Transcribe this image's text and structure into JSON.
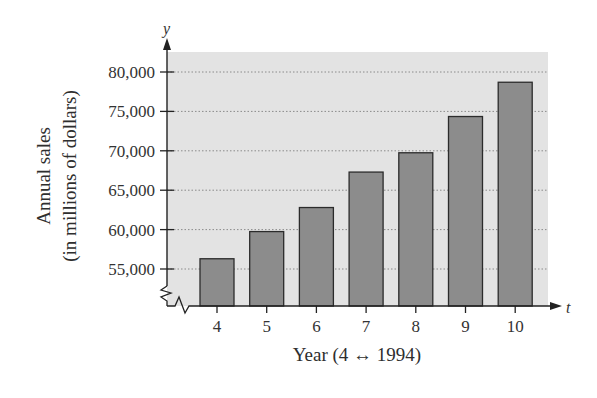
{
  "chart_data": {
    "type": "bar",
    "title": "",
    "xlabel": "Year (4 ↔ 1994)",
    "ylabel_line1": "Annual sales",
    "ylabel_line2": "(in millions of dollars)",
    "x_axis_var": "t",
    "y_axis_var": "y",
    "categories": [
      "4",
      "5",
      "6",
      "7",
      "8",
      "9",
      "10"
    ],
    "values": [
      56300,
      59750,
      62800,
      67300,
      69750,
      74350,
      78700
    ],
    "yticks": [
      55000,
      60000,
      65000,
      70000,
      75000,
      80000
    ],
    "ytick_labels": [
      "55,000",
      "60,000",
      "65,000",
      "70,000",
      "75,000",
      "80,000"
    ],
    "ylim": [
      50000,
      83500
    ],
    "y_axis_break": true,
    "grid": true,
    "grid_style": "dotted horizontal",
    "legend": null,
    "colors": {
      "plot_background": "#e3e3e3",
      "bar_fill": "#8c8c8c",
      "bar_stroke": "#2b2b2b",
      "gridline": "#8a8a8a",
      "axis": "#222222"
    }
  }
}
